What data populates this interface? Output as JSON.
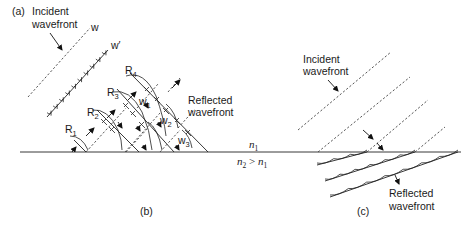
{
  "figure": {
    "panels": [
      {
        "id": "a",
        "label": "(a)"
      },
      {
        "id": "b",
        "label": "(b)"
      },
      {
        "id": "c",
        "label": "(c)"
      }
    ]
  },
  "labels": {
    "panel_a": "(a)",
    "panel_b": "(b)",
    "panel_c": "(c)",
    "incident_a_line1": "Incident",
    "incident_a_line2": "wavefront",
    "w": "w",
    "w_prime": "w′",
    "R1": "R",
    "R1_sub": "1",
    "R2": "R",
    "R2_sub": "2",
    "R3": "R",
    "R3_sub": "3",
    "R4": "R",
    "R4_sub": "4",
    "w1": "w",
    "w1_sub": "1",
    "w2": "w",
    "w2_sub": "2",
    "w3": "w",
    "w3_sub": "3",
    "reflected_b_line1": "Reflected",
    "reflected_b_line2": "wavefront",
    "n1": "n",
    "n1_sub": "1",
    "n2": "n",
    "n2_sub": "2",
    "n2_gt": " > ",
    "n2_n1": "n",
    "n2_n1_sub": "1",
    "incident_c_line1": "Incident",
    "incident_c_line2": "wavefront",
    "reflected_c_line1": "Reflected",
    "reflected_c_line2": "wavefront"
  },
  "media": {
    "upper": "n1",
    "lower": "n2 > n1"
  }
}
